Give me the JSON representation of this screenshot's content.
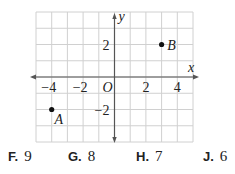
{
  "chart_data": {
    "type": "scatter",
    "title": "",
    "xlabel": "x",
    "ylabel": "y",
    "xlim": [
      -5,
      5
    ],
    "ylim": [
      -4,
      4
    ],
    "grid": true,
    "origin_label": "O",
    "x_ticks": [
      -4,
      -2,
      2,
      4
    ],
    "x_tick_labels": [
      "−4",
      "−2",
      "2",
      "4"
    ],
    "y_ticks": [
      2,
      -2
    ],
    "y_tick_labels": [
      "2",
      "−2"
    ],
    "points": [
      {
        "label": "A",
        "x": -4,
        "y": -2
      },
      {
        "label": "B",
        "x": 3,
        "y": 2
      }
    ]
  },
  "answer_choices": [
    {
      "letter": "F.",
      "value": "9"
    },
    {
      "letter": "G.",
      "value": "8"
    },
    {
      "letter": "H.",
      "value": "7"
    },
    {
      "letter": "J.",
      "value": "6"
    }
  ],
  "colors": {
    "grid": "#d0d0d0",
    "axis": "#555555",
    "text": "#222222"
  }
}
